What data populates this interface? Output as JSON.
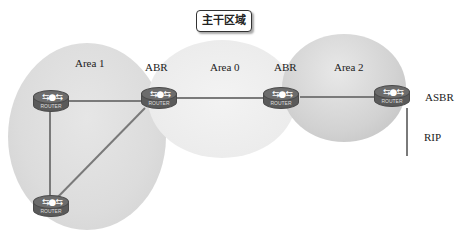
{
  "title": "主干区域",
  "areas": [
    {
      "id": "area1",
      "label": "Area 1"
    },
    {
      "id": "area0",
      "label": "Area 0"
    },
    {
      "id": "area2",
      "label": "Area 2"
    }
  ],
  "role_labels": {
    "abr_left": "ABR",
    "abr_right": "ABR",
    "asbr": "ASBR",
    "rip": "RIP"
  },
  "routers": [
    {
      "id": "r1",
      "label": "ROUTER"
    },
    {
      "id": "r2",
      "label": "ROUTER"
    },
    {
      "id": "r3",
      "label": "ROUTER"
    },
    {
      "id": "r4",
      "label": "ROUTER"
    },
    {
      "id": "r5",
      "label": "ROUTER"
    }
  ],
  "icons": {
    "router_glyph": "⇆●⇆"
  }
}
